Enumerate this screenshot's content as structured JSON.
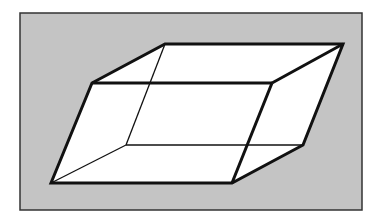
{
  "figure": {
    "type": "parallelepiped-wireframe",
    "colors": {
      "background": "#ffffff",
      "panel_fill": "#c4c4c4",
      "panel_border": "#333333",
      "face_fill": "#ffffff",
      "edge": "#111111"
    },
    "frame": {
      "x": 20,
      "y": 13,
      "width": 342,
      "height": 197
    },
    "vertices": {
      "back_top_left": [
        165,
        44
      ],
      "back_top_right": [
        343,
        44
      ],
      "front_top_left": [
        92,
        83
      ],
      "front_top_right": [
        272,
        83
      ],
      "front_bottom_left": [
        51,
        183
      ],
      "front_bottom_right": [
        232,
        183
      ],
      "back_bottom_left": [
        126,
        145
      ],
      "back_bottom_right": [
        303,
        145
      ]
    }
  }
}
